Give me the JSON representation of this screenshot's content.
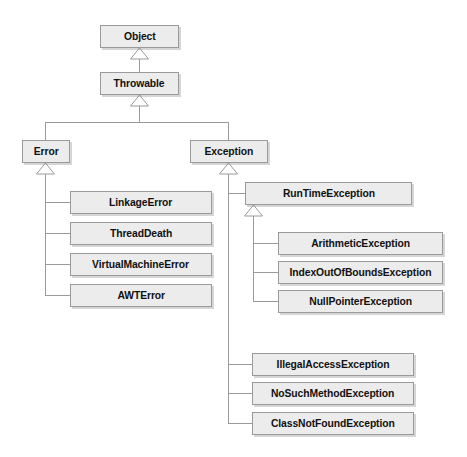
{
  "diagram": {
    "type": "uml-class-hierarchy",
    "background_color": "#ffffff",
    "node_fill_color": "#ececec",
    "node_border_color": "#9a9a9a",
    "text_color": "#111111",
    "edge_color": "#9a9a9a",
    "arrow_style": "hollow-triangle-generalization",
    "nodes": [
      {
        "id": "object",
        "label": "Object",
        "x": 100,
        "y": 25,
        "w": 79,
        "h": 23
      },
      {
        "id": "throwable",
        "label": "Throwable",
        "x": 100,
        "y": 72,
        "w": 79,
        "h": 23
      },
      {
        "id": "error",
        "label": "Error",
        "x": 22,
        "y": 140,
        "w": 48,
        "h": 23
      },
      {
        "id": "exception",
        "label": "Exception",
        "x": 190,
        "y": 140,
        "w": 78,
        "h": 23
      },
      {
        "id": "linkage-error",
        "label": "LinkageError",
        "x": 70,
        "y": 191,
        "w": 142,
        "h": 23
      },
      {
        "id": "thread-death",
        "label": "ThreadDeath",
        "x": 70,
        "y": 222,
        "w": 142,
        "h": 23
      },
      {
        "id": "virtual-machine-error",
        "label": "VirtualMachineError",
        "x": 70,
        "y": 253,
        "w": 142,
        "h": 23
      },
      {
        "id": "awt-error",
        "label": "AWTError",
        "x": 70,
        "y": 284,
        "w": 142,
        "h": 23
      },
      {
        "id": "runtime-exception",
        "label": "RunTimeException",
        "x": 245,
        "y": 182,
        "w": 167,
        "h": 23
      },
      {
        "id": "arithmetic-exception",
        "label": "ArithmeticException",
        "x": 278,
        "y": 232,
        "w": 165,
        "h": 23
      },
      {
        "id": "index-out-of-bounds",
        "label": "IndexOutOfBoundsException",
        "x": 278,
        "y": 261,
        "w": 165,
        "h": 23
      },
      {
        "id": "null-pointer-exception",
        "label": "NullPointerException",
        "x": 278,
        "y": 290,
        "w": 165,
        "h": 23
      },
      {
        "id": "illegal-access-exception",
        "label": "IllegalAccessException",
        "x": 252,
        "y": 353,
        "w": 162,
        "h": 23
      },
      {
        "id": "no-such-method-exception",
        "label": "NoSuchMethodException",
        "x": 252,
        "y": 382,
        "w": 162,
        "h": 23
      },
      {
        "id": "class-not-found-exception",
        "label": "ClassNotFoundException",
        "x": 252,
        "y": 412,
        "w": 162,
        "h": 23
      }
    ],
    "edges": [
      {
        "from": "throwable",
        "to": "object",
        "relation": "extends"
      },
      {
        "from": "error",
        "to": "throwable",
        "relation": "extends"
      },
      {
        "from": "exception",
        "to": "throwable",
        "relation": "extends"
      },
      {
        "from": "linkage-error",
        "to": "error",
        "relation": "extends"
      },
      {
        "from": "thread-death",
        "to": "error",
        "relation": "extends"
      },
      {
        "from": "virtual-machine-error",
        "to": "error",
        "relation": "extends"
      },
      {
        "from": "awt-error",
        "to": "error",
        "relation": "extends"
      },
      {
        "from": "runtime-exception",
        "to": "exception",
        "relation": "extends"
      },
      {
        "from": "arithmetic-exception",
        "to": "runtime-exception",
        "relation": "extends"
      },
      {
        "from": "index-out-of-bounds",
        "to": "runtime-exception",
        "relation": "extends"
      },
      {
        "from": "null-pointer-exception",
        "to": "runtime-exception",
        "relation": "extends"
      },
      {
        "from": "illegal-access-exception",
        "to": "exception",
        "relation": "extends"
      },
      {
        "from": "no-such-method-exception",
        "to": "exception",
        "relation": "extends"
      },
      {
        "from": "class-not-found-exception",
        "to": "exception",
        "relation": "extends"
      }
    ]
  }
}
